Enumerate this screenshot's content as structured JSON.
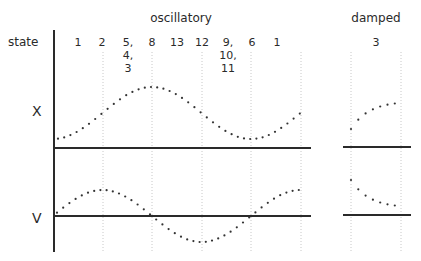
{
  "diagram": {
    "row_label": "state",
    "sections": [
      {
        "title": "oscillatory",
        "states": [
          {
            "x": 78,
            "lines": [
              "1"
            ]
          },
          {
            "x": 102,
            "lines": [
              "2"
            ]
          },
          {
            "x": 128,
            "lines": [
              "5,",
              "4,",
              "3"
            ]
          },
          {
            "x": 152,
            "lines": [
              "8"
            ]
          },
          {
            "x": 177,
            "lines": [
              "13"
            ]
          },
          {
            "x": 202,
            "lines": [
              "12"
            ]
          },
          {
            "x": 228,
            "lines": [
              "9,",
              "10,",
              "11"
            ]
          },
          {
            "x": 252,
            "lines": [
              "6"
            ]
          },
          {
            "x": 277,
            "lines": [
              "1"
            ]
          }
        ]
      },
      {
        "title": "damped",
        "states": [
          {
            "x": 376,
            "lines": [
              "3"
            ]
          }
        ]
      }
    ],
    "plots": [
      {
        "name": "x-plot",
        "label": "X"
      },
      {
        "name": "v-plot",
        "label": "V"
      }
    ],
    "colors": {
      "ink": "#2a2a2a",
      "grid": "#c8c8c8",
      "dots": "#333333"
    }
  }
}
